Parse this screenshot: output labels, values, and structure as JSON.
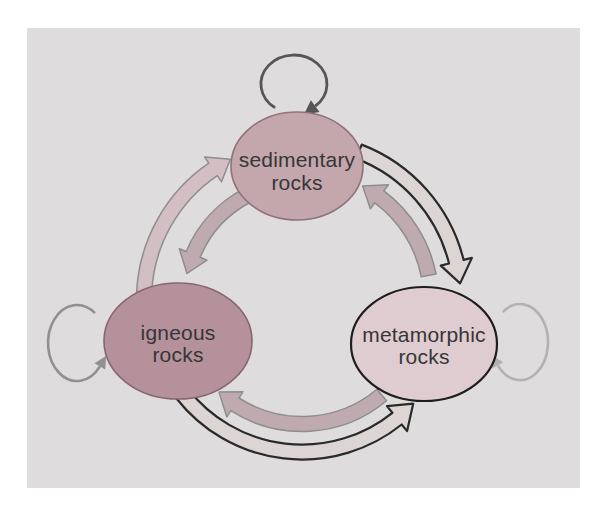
{
  "diagram": {
    "nodes": [
      {
        "id": "sedimentary",
        "line1": "sedimentary",
        "line2": "rocks",
        "fill": "#c4a6ad",
        "border": "#8f727b"
      },
      {
        "id": "igneous",
        "line1": "igneous",
        "line2": "rocks",
        "fill": "#b5919c",
        "border": "#876672"
      },
      {
        "id": "metamorphic",
        "line1": "metamorphic",
        "line2": "rocks",
        "fill": "#dfccd1",
        "border": "#1e1e1e"
      }
    ],
    "edges": [
      {
        "from": "igneous rocks",
        "to": "sedimentary rocks",
        "style": "light"
      },
      {
        "from": "sedimentary rocks",
        "to": "igneous rocks",
        "style": "salmon"
      },
      {
        "from": "metamorphic rocks",
        "to": "sedimentary rocks",
        "style": "salmon"
      },
      {
        "from": "sedimentary rocks",
        "to": "metamorphic rocks",
        "style": "outlined"
      },
      {
        "from": "metamorphic rocks",
        "to": "igneous rocks",
        "style": "salmon"
      },
      {
        "from": "igneous rocks",
        "to": "metamorphic rocks",
        "style": "outlined"
      }
    ],
    "self_loops": [
      {
        "node": "sedimentary rocks"
      },
      {
        "node": "igneous rocks"
      },
      {
        "node": "metamorphic rocks"
      }
    ],
    "colors": {
      "page_bg": "#ffffff",
      "panel_bg": "#dedcdc",
      "salmon_arrow_fill": "#bfaab0",
      "light_arrow_fill": "#d2bec3",
      "cream_arrow_fill": "#ddd5d4",
      "gray_outline": "#8e8e8e",
      "black_outline": "#2a2a2a",
      "sed_loop": "#565656",
      "ig_loop": "#909090",
      "met_loop": "#b2b2b2",
      "text": "#363636"
    }
  }
}
